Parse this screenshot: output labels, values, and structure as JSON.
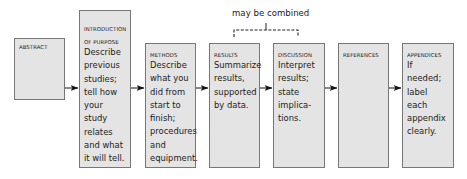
{
  "annotation": {
    "text": "may be combined",
    "spans": [
      "results",
      "discussion"
    ]
  },
  "sections": [
    {
      "id": "abstract",
      "heading": "ABSTRACT",
      "body": ""
    },
    {
      "id": "introduction",
      "heading": "INTRODUCTION OF PURPOSE",
      "heading_line1": "INTRODUCTION",
      "heading_line2": "OF PURPOSE",
      "body": "Describe\nprevious\nstudies;\ntell how\nyour study\nrelates\nand what\nit will tell."
    },
    {
      "id": "methods",
      "heading": "METHODS",
      "body": "Describe\nwhat you\ndid from\nstart to\nfinish;\nprocedures\nand\nequipment."
    },
    {
      "id": "results",
      "heading": "RESULTS",
      "body": "Summarize\nresults,\nsupported\nby data."
    },
    {
      "id": "discussion",
      "heading": "DISCUSSION",
      "body": "Interpret\nresults;\nstate\nimplica-\ntions."
    },
    {
      "id": "references",
      "heading": "REFERENCES",
      "body": ""
    },
    {
      "id": "appendices",
      "heading": "APPENDICES",
      "body": "If needed;\nlabel each\nappendix\nclearly."
    }
  ],
  "colors": {
    "box_fill": "#e4e4e4",
    "box_border": "#777777",
    "arrow": "#111111",
    "text": "#222222"
  }
}
